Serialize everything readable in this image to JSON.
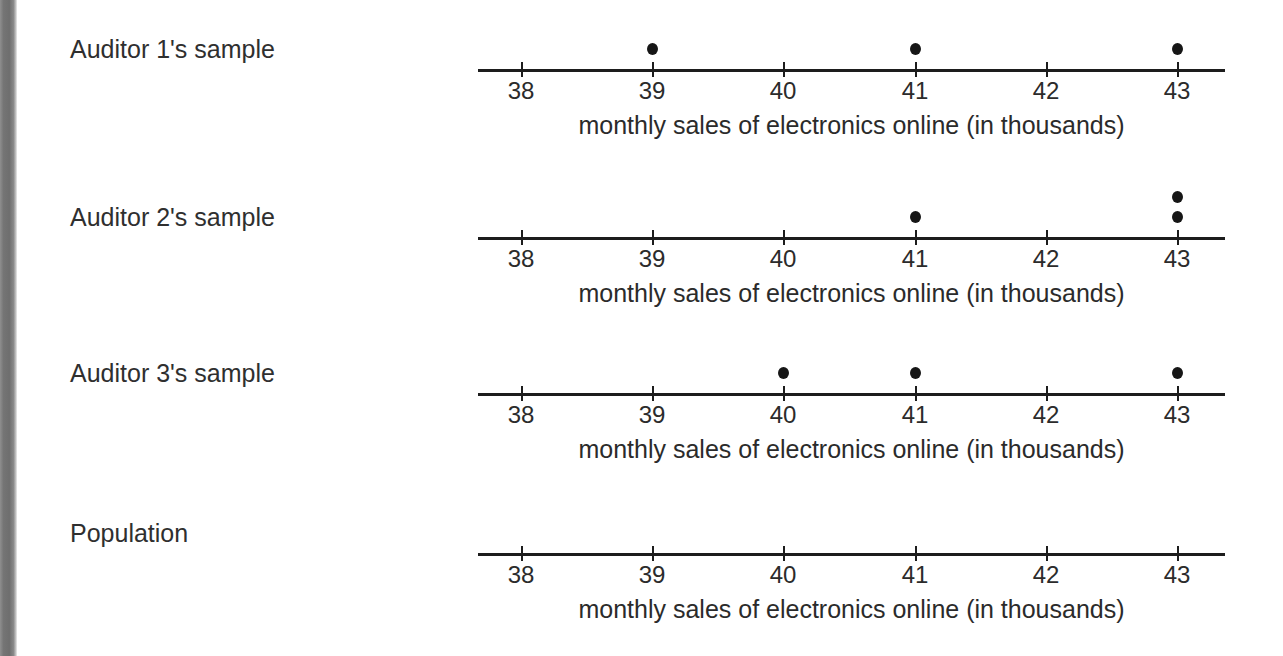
{
  "page": {
    "background_color": "#ffffff",
    "edge_strip_color": "#757575",
    "ink_color": "#1d1d1d",
    "dot_color": "#161616"
  },
  "axis_caption": "monthly sales of electronics online (in thousands)",
  "tick_labels": [
    "38",
    "39",
    "40",
    "41",
    "42",
    "43"
  ],
  "plots": [
    {
      "label": "Auditor 1's sample",
      "caption": "monthly sales of electronics online (in thousands)"
    },
    {
      "label": "Auditor 2's sample",
      "caption": "monthly sales of electronics online (in thousands)"
    },
    {
      "label": "Auditor 3's sample",
      "caption": "monthly sales of electronics online (in thousands)"
    },
    {
      "label": "Population",
      "caption": "monthly sales of electronics online (in thousands)"
    }
  ],
  "chart_data": {
    "type": "scatter",
    "title": "",
    "xlabel": "monthly sales of electronics online (in thousands)",
    "ylabel": "",
    "xlim": [
      37.67,
      43.36
    ],
    "ticks": [
      38,
      39,
      40,
      41,
      42,
      43
    ],
    "grid": false,
    "legend": "none",
    "subplots": [
      {
        "name": "Auditor 1's sample",
        "type": "dotplot",
        "xlabel": "monthly sales of electronics online (in thousands)",
        "values": [
          39,
          41,
          43
        ],
        "counts": {
          "38": 0,
          "39": 1,
          "40": 0,
          "41": 1,
          "42": 0,
          "43": 1
        }
      },
      {
        "name": "Auditor 2's sample",
        "type": "dotplot",
        "xlabel": "monthly sales of electronics online (in thousands)",
        "values": [
          41,
          43,
          43
        ],
        "counts": {
          "38": 0,
          "39": 0,
          "40": 0,
          "41": 1,
          "42": 0,
          "43": 2
        }
      },
      {
        "name": "Auditor 3's sample",
        "type": "dotplot",
        "xlabel": "monthly sales of electronics online (in thousands)",
        "values": [
          40,
          41,
          43
        ],
        "counts": {
          "38": 0,
          "39": 0,
          "40": 1,
          "41": 1,
          "42": 0,
          "43": 1
        }
      },
      {
        "name": "Population",
        "type": "dotplot",
        "xlabel": "monthly sales of electronics online (in thousands)",
        "values": [],
        "counts": {
          "38": 0,
          "39": 0,
          "40": 0,
          "41": 0,
          "42": 0,
          "43": 0
        }
      }
    ]
  },
  "layout": {
    "plot_tops": [
      20,
      188,
      344,
      504
    ],
    "label_offsets": [
      14,
      14,
      14,
      14
    ],
    "axis_y": 49,
    "tick_label_y": 58,
    "caption_y": 90,
    "tick_x": [
      43,
      174,
      305,
      437,
      568,
      699
    ]
  }
}
